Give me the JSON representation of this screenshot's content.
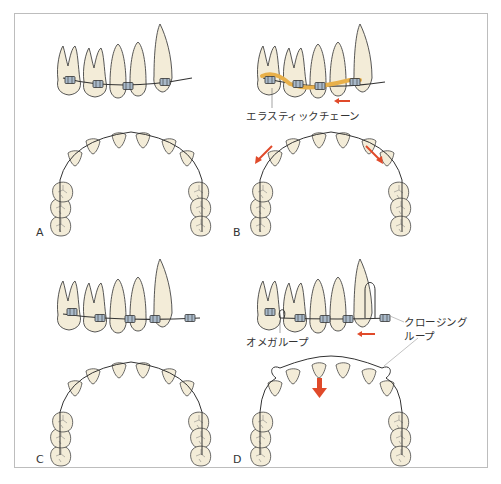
{
  "figure": {
    "panels": [
      {
        "id": "A",
        "label": "A",
        "description": "Initial arch with brackets and archwire"
      },
      {
        "id": "B",
        "label": "B",
        "description": "Space closure using elastic chain"
      },
      {
        "id": "C",
        "label": "C",
        "description": "Arch aligned with brackets and archwire"
      },
      {
        "id": "D",
        "label": "D",
        "description": "Space closure using closing loop and omega loop"
      }
    ],
    "annotations": {
      "elastic_chain": "エラスティックチェーン",
      "omega_loop": "オメガループ",
      "closing_loop_line1": "クロージング",
      "closing_loop_line2": "ループ"
    },
    "colors": {
      "tooth_fill": "#f3ecd8",
      "tooth_stroke": "#444444",
      "wire": "#333333",
      "bracket": "#a9b9c9",
      "elastic_chain": "#e8b04a",
      "arrow": "#e04a2a",
      "frame_border": "#bdbdbd"
    }
  }
}
